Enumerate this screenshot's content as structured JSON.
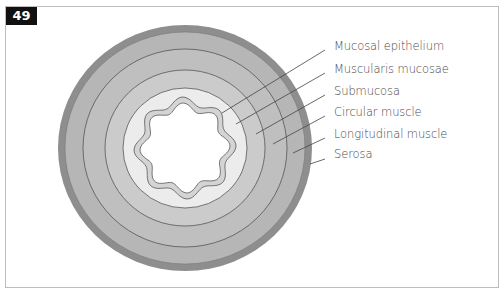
{
  "figure": {
    "number": "49",
    "colors": {
      "outer_band": "#8e8e8e",
      "serosa": "#b6b6b6",
      "longitudinal_muscle": "#bdbdbd",
      "circular_muscle": "#c9c9c9",
      "submucosa": "#ebebeb",
      "mucosa": "#d6d6d6",
      "lumen": "#ffffff",
      "lines": "#555555"
    }
  },
  "labels": [
    {
      "text": "Mucosal epithelium",
      "y": 39
    },
    {
      "text": "Muscularis mucosae",
      "y": 62
    },
    {
      "text": "Submucosa",
      "y": 84
    },
    {
      "text": "Circular muscle",
      "y": 105
    },
    {
      "text": "Longitudinal muscle",
      "y": 127
    },
    {
      "text": "Serosa",
      "y": 147
    }
  ]
}
